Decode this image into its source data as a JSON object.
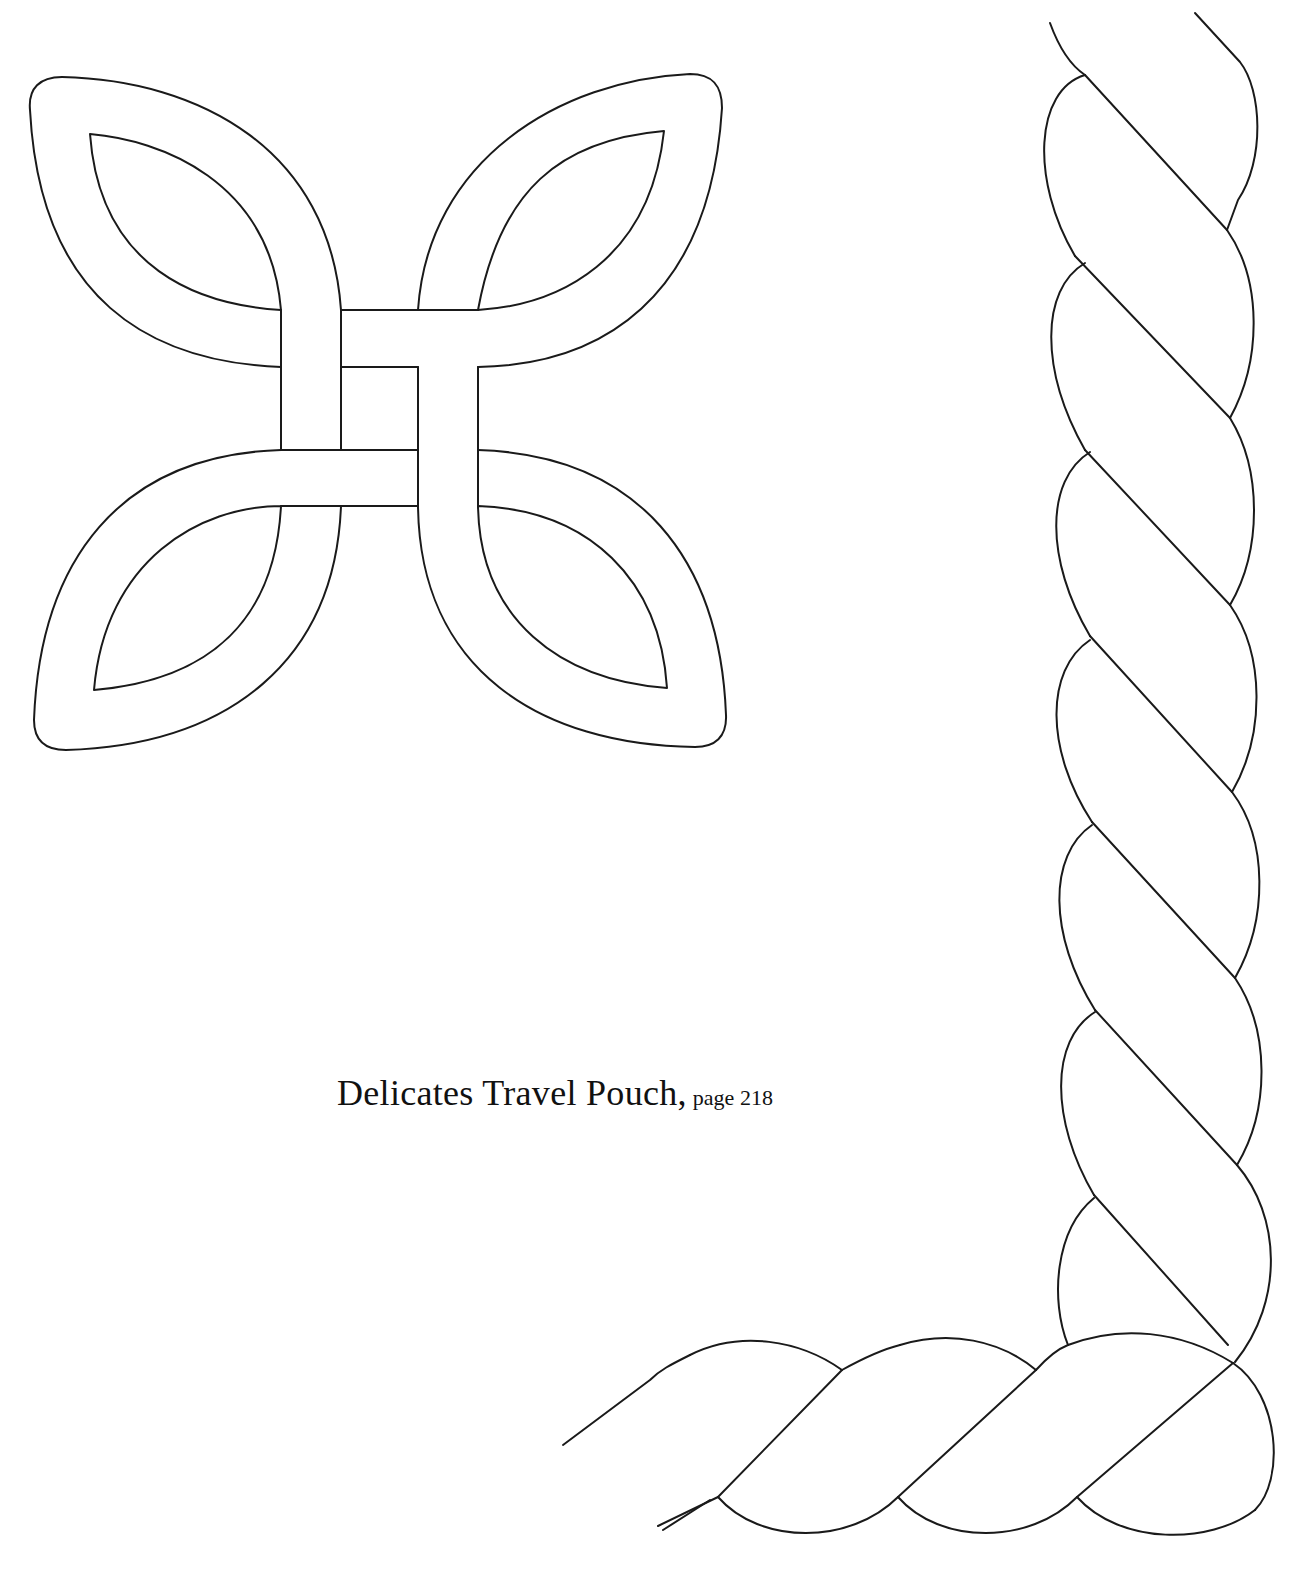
{
  "page": {
    "top_cutoff_text": "page",
    "caption": {
      "title": "Delicates Travel Pouch,",
      "page_ref": "page 218"
    }
  },
  "illustrations": [
    {
      "name": "celtic-knot-quilting-motif",
      "type": "four-loop knot with woven center"
    },
    {
      "name": "rope-twist-border-corner",
      "type": "twisted cable border turning corner"
    }
  ],
  "colors": {
    "background": "#ffffff",
    "line": "#1a1a1a",
    "text": "#111111"
  }
}
